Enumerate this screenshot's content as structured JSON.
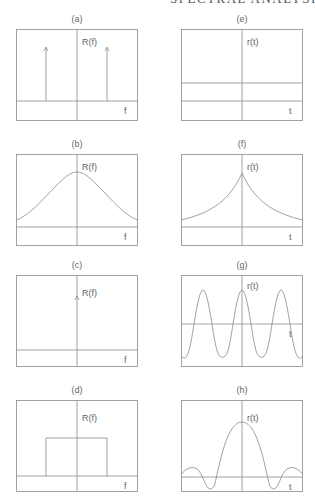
{
  "running_head": "SPECTRAL ANALYSIS",
  "colors": {
    "line": "#8a8a8a",
    "text": "#666666",
    "background": "#ffffff"
  },
  "panels": [
    {
      "id": "a",
      "label": "(a)",
      "func_label": "R(f)",
      "axis_label": "f",
      "shape": "two impulses at ±f0"
    },
    {
      "id": "b",
      "label": "(b)",
      "func_label": "R(f)",
      "axis_label": "f",
      "shape": "bell-shaped (Lorentzian) spectrum"
    },
    {
      "id": "c",
      "label": "(c)",
      "func_label": "R(f)",
      "axis_label": "f",
      "shape": "single impulse at f=0"
    },
    {
      "id": "d",
      "label": "(d)",
      "func_label": "R(f)",
      "axis_label": "f",
      "shape": "rectangular band-limited spectrum"
    },
    {
      "id": "e",
      "label": "(e)",
      "func_label": "r(t)",
      "axis_label": "t",
      "shape": "constant"
    },
    {
      "id": "f",
      "label": "(f)",
      "func_label": "r(t)",
      "axis_label": "t",
      "shape": "two-sided exponential decay"
    },
    {
      "id": "g",
      "label": "(g)",
      "func_label": "r(t)",
      "axis_label": "t",
      "shape": "cosine"
    },
    {
      "id": "h",
      "label": "(h)",
      "func_label": "r(t)",
      "axis_label": "t",
      "shape": "sinc"
    }
  ]
}
